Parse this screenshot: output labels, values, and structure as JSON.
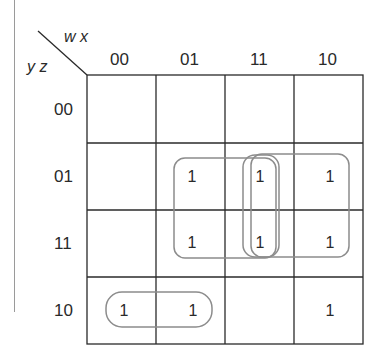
{
  "kmap": {
    "row_variables": "y z",
    "column_variables": "w x",
    "column_labels": [
      "00",
      "01",
      "11",
      "10"
    ],
    "row_labels": [
      "00",
      "01",
      "11",
      "10"
    ],
    "cells": [
      [
        "",
        "",
        "",
        ""
      ],
      [
        "",
        "1",
        "1",
        "1"
      ],
      [
        "",
        "1",
        "1",
        "1"
      ],
      [
        "1",
        "1",
        "",
        "1"
      ]
    ],
    "groups": [
      {
        "name": "group-01-11-cols-01-11",
        "rows": [
          "01",
          "11"
        ],
        "cols": [
          "01",
          "11"
        ]
      },
      {
        "name": "group-col-11",
        "rows": [
          "01",
          "11"
        ],
        "cols": [
          "11"
        ]
      },
      {
        "name": "group-01-11-cols-11-10",
        "rows": [
          "01",
          "11"
        ],
        "cols": [
          "11",
          "10"
        ]
      },
      {
        "name": "group-row-10-cols-00-01",
        "rows": [
          "10"
        ],
        "cols": [
          "00",
          "01"
        ]
      }
    ],
    "colors": {
      "grid": "#2a2a2a",
      "loop": "#8c8c8c"
    }
  }
}
